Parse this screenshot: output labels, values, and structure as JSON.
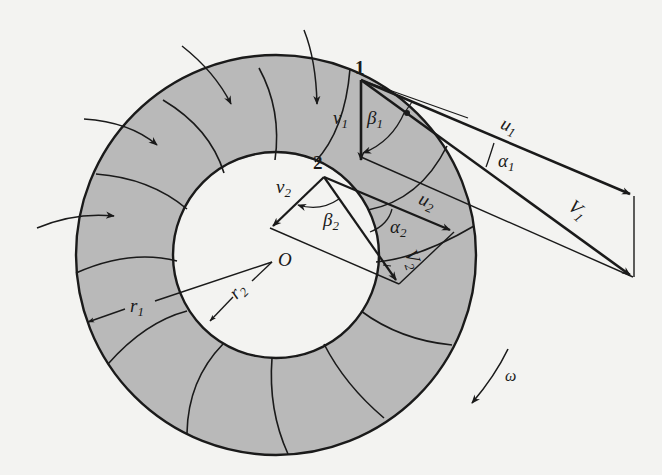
{
  "figure": {
    "colors": {
      "background": "#f3f3f1",
      "ring_fill": "#b9b9b9",
      "stroke": "#1a1a1a"
    },
    "labels": {
      "point_inlet": "1",
      "point_outlet": "2",
      "center": "O",
      "v1": "v",
      "v1_sub": "1",
      "beta1": "β",
      "beta1_sub": "1",
      "u1": "u",
      "u1_sub": "1",
      "alpha1": "α",
      "alpha1_sub": "1",
      "V1": "V",
      "V1_sub": "1",
      "v2": "v",
      "v2_sub": "2",
      "beta2": "β",
      "beta2_sub": "2",
      "u2": "u",
      "u2_sub": "2",
      "alpha2": "α",
      "alpha2_sub": "2",
      "V2": "V",
      "V2_sub": "2",
      "r1": "r",
      "r1_sub": "1",
      "r2": "r",
      "r2_sub": "2",
      "omega": "ω"
    }
  }
}
